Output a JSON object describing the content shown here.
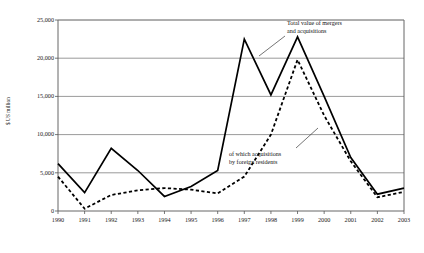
{
  "axes": {
    "y_title": "$ US million",
    "y_ticks": [
      "0",
      "5,000",
      "10,000",
      "15,000",
      "20,000",
      "25,000"
    ],
    "x_ticks": [
      "1990",
      "1991",
      "1992",
      "1993",
      "1994",
      "1995",
      "1996",
      "1997",
      "1998",
      "1999",
      "2000",
      "2001",
      "2002",
      "2003"
    ]
  },
  "annotations": {
    "total": "Total value of mergers\nand acquisitions",
    "foreign": "of which acquisitions\nby foreign residents"
  },
  "colors": {
    "line": "#000000",
    "grid": "#808080",
    "axis": "#555555",
    "text": "#1a1a1a",
    "background": "#ffffff"
  },
  "chart_data": {
    "type": "line",
    "title": "",
    "xlabel": "",
    "ylabel": "$ US million",
    "ylim": [
      0,
      25000
    ],
    "ytick_step": 5000,
    "grid": true,
    "legend": "annotations-inline",
    "categories": [
      "1990",
      "1991",
      "1992",
      "1993",
      "1994",
      "1995",
      "1996",
      "1997",
      "1998",
      "1999",
      "2000",
      "2001",
      "2002",
      "2003"
    ],
    "series": [
      {
        "name": "Total value of mergers and acquisitions",
        "style": "solid",
        "values": [
          6200,
          2400,
          8200,
          5300,
          1900,
          3200,
          5300,
          22500,
          15200,
          22800,
          15000,
          7000,
          2200,
          3000
        ]
      },
      {
        "name": "of which acquisitions by foreign residents",
        "style": "dashed",
        "values": [
          4500,
          300,
          2100,
          2700,
          3000,
          2800,
          2300,
          4500,
          10000,
          19800,
          12500,
          6500,
          1800,
          2500
        ]
      }
    ]
  }
}
